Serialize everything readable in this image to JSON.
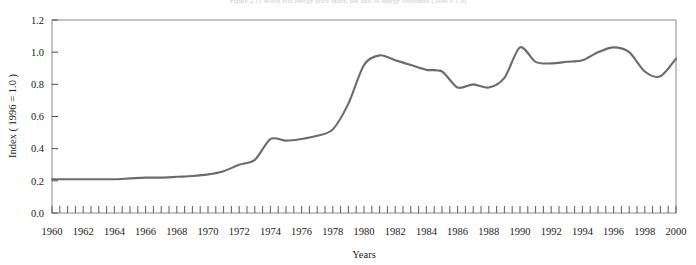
{
  "figure": {
    "caption": "Figure 2.11   World real energy price index, per unit of energy consumed (1996 = 1.0)"
  },
  "chart_data": {
    "type": "line",
    "title": "",
    "xlabel": "Years",
    "ylabel": "Index ( 1996 = 1.0 )",
    "xlim": [
      1960,
      2000
    ],
    "ylim": [
      0.0,
      1.2
    ],
    "grid": false,
    "legend": null,
    "line_color": "#6b6b6b",
    "y_ticks": [
      "0.0",
      "0.2",
      "0.4",
      "0.6",
      "0.8",
      "1.0",
      "1.2"
    ],
    "y_tick_values": [
      0.0,
      0.2,
      0.4,
      0.6,
      0.8,
      1.0,
      1.2
    ],
    "x_ticks": [
      "1960",
      "1962",
      "1964",
      "1966",
      "1968",
      "1970",
      "1972",
      "1974",
      "1976",
      "1978",
      "1980",
      "1982",
      "1984",
      "1986",
      "1988",
      "1990",
      "1992",
      "1994",
      "1996",
      "1998",
      "2000"
    ],
    "x_tick_values": [
      1960,
      1962,
      1964,
      1966,
      1968,
      1970,
      1972,
      1974,
      1976,
      1978,
      1980,
      1982,
      1984,
      1986,
      1988,
      1990,
      1992,
      1994,
      1996,
      1998,
      2000
    ],
    "x_minor_tick_step": 1,
    "series": [
      {
        "name": "Real energy price index",
        "x": [
          1960,
          1961,
          1962,
          1963,
          1964,
          1965,
          1966,
          1967,
          1968,
          1969,
          1970,
          1971,
          1972,
          1973,
          1974,
          1975,
          1976,
          1977,
          1978,
          1979,
          1980,
          1981,
          1982,
          1983,
          1984,
          1985,
          1986,
          1987,
          1988,
          1989,
          1990,
          1991,
          1992,
          1993,
          1994,
          1995,
          1996,
          1997,
          1998,
          1999,
          2000
        ],
        "values": [
          0.21,
          0.21,
          0.21,
          0.21,
          0.21,
          0.215,
          0.22,
          0.22,
          0.225,
          0.23,
          0.24,
          0.26,
          0.3,
          0.33,
          0.46,
          0.45,
          0.46,
          0.48,
          0.52,
          0.68,
          0.92,
          0.98,
          0.95,
          0.92,
          0.89,
          0.88,
          0.78,
          0.8,
          0.78,
          0.84,
          1.03,
          0.94,
          0.93,
          0.94,
          0.95,
          1.0,
          1.03,
          1.0,
          0.88,
          0.85,
          0.96
        ]
      }
    ]
  }
}
